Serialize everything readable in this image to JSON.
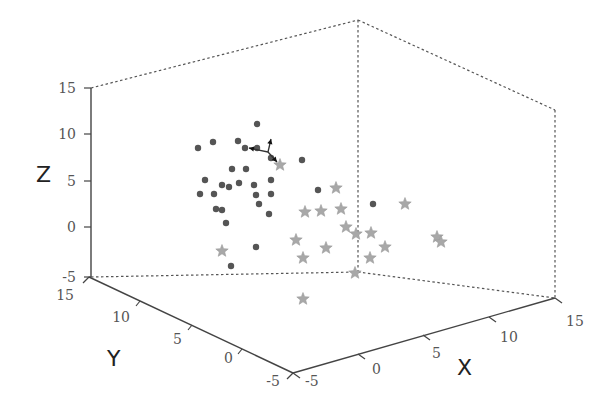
{
  "chart_data": {
    "type": "scatter",
    "dimensions": 3,
    "title": "",
    "xlabel": "X",
    "ylabel": "Y",
    "zlabel": "Z",
    "xlim": [
      -5,
      15
    ],
    "ylim": [
      -5,
      15
    ],
    "zlim": [
      -5,
      15
    ],
    "x_ticks": [
      "-5",
      "0",
      "5",
      "10",
      "15"
    ],
    "y_ticks": [
      "-5",
      "0",
      "5",
      "10",
      "15"
    ],
    "z_ticks": [
      "-5",
      "0",
      "5",
      "10",
      "15"
    ],
    "grid": false,
    "box": "dotted",
    "legend": null,
    "series": [
      {
        "name": "class-1-dots",
        "marker": "circle",
        "color": "#555555",
        "screen_points": [
          [
            257,
            124
          ],
          [
            213,
            142
          ],
          [
            238,
            141
          ],
          [
            198,
            148
          ],
          [
            245,
            148
          ],
          [
            257,
            148
          ],
          [
            271,
            158
          ],
          [
            302,
            160
          ],
          [
            232,
            169
          ],
          [
            246,
            169
          ],
          [
            205,
            180
          ],
          [
            222,
            185
          ],
          [
            229,
            187
          ],
          [
            239,
            183
          ],
          [
            254,
            185
          ],
          [
            271,
            180
          ],
          [
            200,
            194
          ],
          [
            214,
            194
          ],
          [
            256,
            195
          ],
          [
            271,
            194
          ],
          [
            259,
            204
          ],
          [
            216,
            209
          ],
          [
            222,
            210
          ],
          [
            269,
            214
          ],
          [
            226,
            223
          ],
          [
            318,
            190
          ],
          [
            373,
            204
          ],
          [
            256,
            247
          ],
          [
            231,
            266
          ]
        ]
      },
      {
        "name": "class-2-stars",
        "marker": "star",
        "color": "#a8a8a8",
        "screen_points": [
          [
            280,
            165
          ],
          [
            336,
            188
          ],
          [
            305,
            212
          ],
          [
            321,
            211
          ],
          [
            341,
            209
          ],
          [
            405,
            204
          ],
          [
            346,
            227
          ],
          [
            356,
            234
          ],
          [
            371,
            233
          ],
          [
            296,
            240
          ],
          [
            326,
            248
          ],
          [
            385,
            247
          ],
          [
            437,
            237
          ],
          [
            441,
            242
          ],
          [
            222,
            251
          ],
          [
            303,
            258
          ],
          [
            370,
            258
          ],
          [
            355,
            273
          ],
          [
            303,
            299
          ]
        ]
      }
    ],
    "annotations": [
      {
        "type": "eigenvector-arrows",
        "origin_screen": [
          268,
          152
        ],
        "tips_screen": [
          [
            249,
            148
          ],
          [
            271,
            139
          ],
          [
            277,
            162
          ]
        ]
      }
    ]
  }
}
